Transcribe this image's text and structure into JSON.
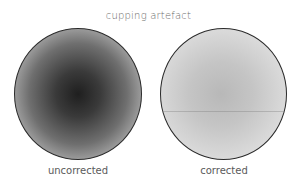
{
  "figure": {
    "title": "cupping artefact",
    "panels": [
      {
        "label": "uncorrected",
        "appearance": "dark center fading to light edge (cupping)"
      },
      {
        "label": "corrected",
        "appearance": "nearly uniform light gray with faint horizontal line"
      }
    ],
    "colors": {
      "outline": "#2a2a2a",
      "uncorrected_center": "#1f1f1f",
      "uncorrected_edge": "#ececec",
      "corrected_center": "#b8b8b8",
      "corrected_edge": "#f2f2f2",
      "text": "#5a5a5a"
    }
  }
}
